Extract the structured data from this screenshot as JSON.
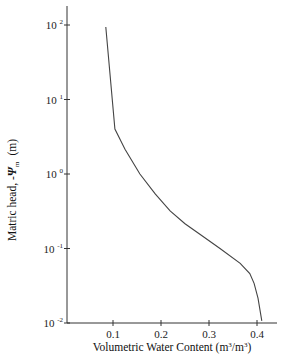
{
  "chart_data": {
    "type": "line",
    "title": "",
    "xlabel": "Volumetric Water Content (m³/m³)",
    "ylabel": "Matric head, -Ψm (m)",
    "xlim": [
      0.0,
      0.43
    ],
    "ylim": [
      0.01,
      100
    ],
    "yscale": "log",
    "grid": false,
    "legend": null,
    "x_ticks": [
      {
        "value": 0.1,
        "label": "0.1"
      },
      {
        "value": 0.2,
        "label": "0.2"
      },
      {
        "value": 0.3,
        "label": "0.3"
      },
      {
        "value": 0.4,
        "label": "0.4"
      }
    ],
    "y_ticks": [
      {
        "value": 100,
        "base": "10",
        "exp": "2"
      },
      {
        "value": 10,
        "base": "10",
        "exp": "1"
      },
      {
        "value": 1,
        "base": "10",
        "exp": "0"
      },
      {
        "value": 0.1,
        "base": "10",
        "exp": "-1"
      },
      {
        "value": 0.01,
        "base": "10",
        "exp": "-2"
      }
    ],
    "series": [
      {
        "name": "Water retention curve",
        "x": [
          0.085,
          0.104,
          0.125,
          0.156,
          0.188,
          0.219,
          0.25,
          0.281,
          0.323,
          0.365,
          0.385,
          0.394,
          0.402,
          0.41
        ],
        "y": [
          94,
          4.0,
          2.15,
          1.0,
          0.54,
          0.32,
          0.215,
          0.155,
          0.1,
          0.063,
          0.046,
          0.034,
          0.0215,
          0.0107
        ]
      }
    ]
  },
  "labels": {
    "xlabel_main": "Volumetric Water Content (m",
    "xlabel_sup1": "3",
    "xlabel_mid": "/m",
    "xlabel_sup2": "3",
    "xlabel_end": ")",
    "ylabel_main": "Matric head, -",
    "ylabel_psi": "Ψ",
    "ylabel_sub": "m",
    "ylabel_unit": "(m)"
  }
}
